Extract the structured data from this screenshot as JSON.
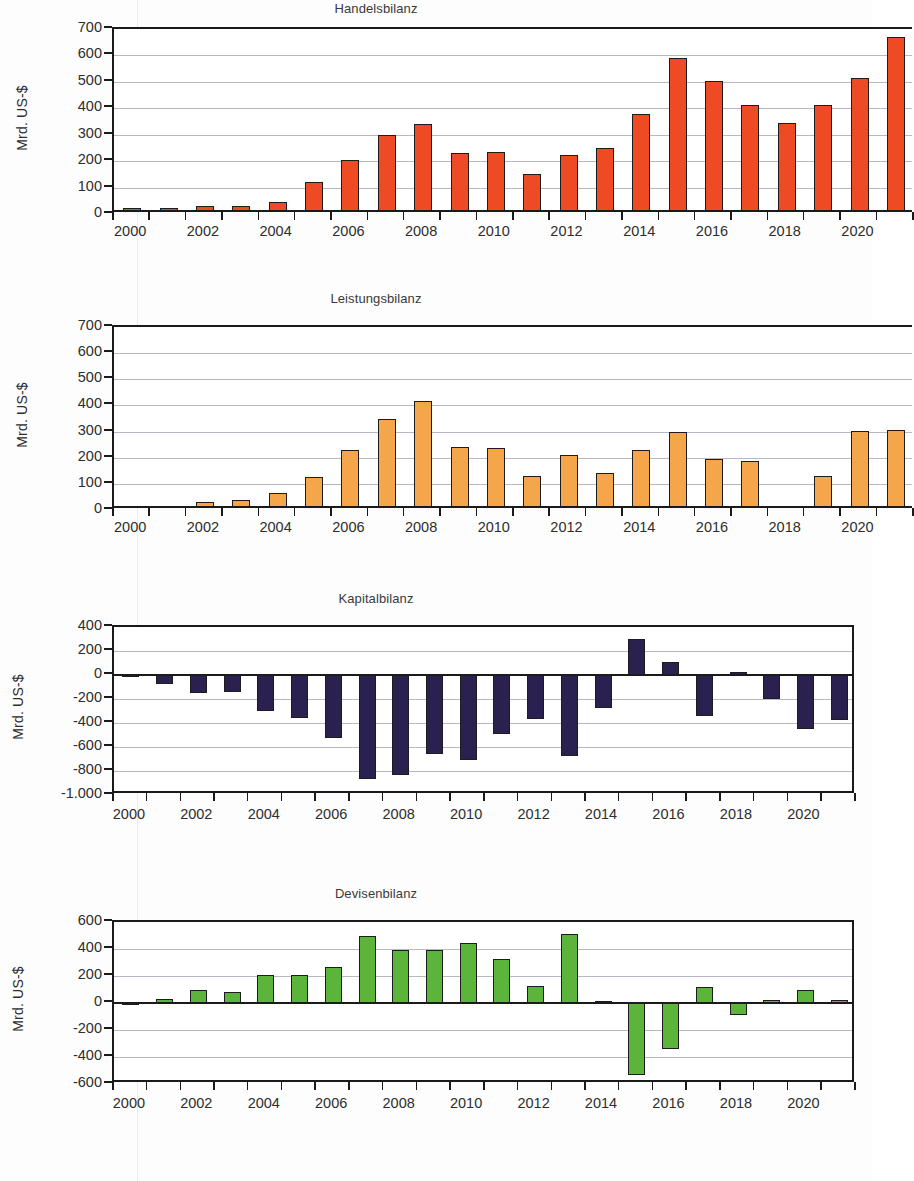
{
  "document": {
    "language": "de",
    "ylabel_text": "Mrd. US-$"
  },
  "palette": {
    "handelsbilanz": "#EE4B24",
    "leistungsbilanz": "#F5A githubPLACEHOLDER",
    "kapitalbilanz": "#2B2150",
    "devisenbilanz": "#5CB53A",
    "bar_outline": "#1C1C1C",
    "axis": "#1A1A1A",
    "grid": "#B9B9C4",
    "text": "#2D2D2D"
  },
  "chart_data": [
    {
      "id": "handelsbilanz",
      "type": "bar",
      "title": "Handelsbilanz",
      "ylabel": "Mrd. US-$",
      "xlabel": "",
      "color": "#EE4B24",
      "ylim": [
        0,
        700
      ],
      "yticks": [
        0,
        100,
        200,
        300,
        400,
        500,
        600,
        700
      ],
      "ytick_labels": [
        "0",
        "100",
        "200",
        "300",
        "400",
        "500",
        "600",
        "700"
      ],
      "grid": true,
      "legend": "none",
      "x": [
        2000,
        2001,
        2002,
        2003,
        2004,
        2005,
        2006,
        2007,
        2008,
        2009,
        2010,
        2011,
        2012,
        2013,
        2014,
        2015,
        2016,
        2017,
        2018,
        2019,
        2020,
        2021
      ],
      "xtick_labels": [
        "2000",
        "2002",
        "2004",
        "2006",
        "2008",
        "2010",
        "2012",
        "2014",
        "2016",
        "2018",
        "2020"
      ],
      "values": [
        24,
        22,
        30,
        32,
        44,
        120,
        204,
        301,
        341,
        232,
        234,
        150,
        225,
        251,
        377,
        590,
        503,
        412,
        343,
        414,
        516,
        670
      ]
    },
    {
      "id": "leistungsbilanz",
      "type": "bar",
      "title": "Leistungsbilanz",
      "ylabel": "Mrd. US-$",
      "xlabel": "",
      "color": "#F5A64A",
      "ylim": [
        0,
        700
      ],
      "yticks": [
        0,
        100,
        200,
        300,
        400,
        500,
        600,
        700
      ],
      "ytick_labels": [
        "0",
        "100",
        "200",
        "300",
        "400",
        "500",
        "600",
        "700"
      ],
      "grid": true,
      "legend": "none",
      "x": [
        2000,
        2001,
        2002,
        2003,
        2004,
        2005,
        2006,
        2007,
        2008,
        2009,
        2010,
        2011,
        2012,
        2013,
        2014,
        2015,
        2016,
        2017,
        2018,
        2019,
        2020,
        2021
      ],
      "xtick_labels": [
        "2000",
        "2002",
        "2004",
        "2006",
        "2008",
        "2010",
        "2012",
        "2014",
        "2016",
        "2018",
        "2020"
      ],
      "values": [
        16,
        12,
        31,
        39,
        65,
        128,
        230,
        350,
        417,
        240,
        236,
        130,
        210,
        143,
        231,
        299,
        196,
        189,
        15,
        131,
        302,
        308
      ]
    },
    {
      "id": "kapitalbilanz",
      "type": "bar",
      "title": "Kapitalbilanz",
      "ylabel": "Mrd. US-$",
      "xlabel": "",
      "color": "#2B2150",
      "ylim": [
        -1000,
        400
      ],
      "yticks": [
        -1000,
        -800,
        -600,
        -400,
        -200,
        0,
        200,
        400
      ],
      "ytick_labels": [
        "-1.000",
        "-800",
        "-600",
        "-400",
        "-200",
        "0",
        "200",
        "400"
      ],
      "grid": true,
      "legend": "none",
      "x": [
        2000,
        2001,
        2002,
        2003,
        2004,
        2005,
        2006,
        2007,
        2008,
        2009,
        2010,
        2011,
        2012,
        2013,
        2014,
        2015,
        2016,
        2017,
        2018,
        2019,
        2020,
        2021
      ],
      "xtick_labels": [
        "2000",
        "2002",
        "2004",
        "2006",
        "2008",
        "2010",
        "2012",
        "2014",
        "2016",
        "2018",
        "2020"
      ],
      "values": [
        -20,
        -72,
        -147,
        -143,
        -300,
        -355,
        -521,
        -868,
        -833,
        -659,
        -706,
        -491,
        -369,
        -673,
        -276,
        298,
        107,
        -345,
        25,
        -199,
        -450,
        -375
      ]
    },
    {
      "id": "devisenbilanz",
      "type": "bar",
      "title": "Devisenbilanz",
      "ylabel": "Mrd. US-$",
      "xlabel": "",
      "color": "#5CB53A",
      "ylim": [
        -600,
        600
      ],
      "yticks": [
        -600,
        -400,
        -200,
        0,
        200,
        400,
        600
      ],
      "ytick_labels": [
        "-600",
        "-400",
        "-200",
        "0",
        "200",
        "400",
        "600"
      ],
      "grid": true,
      "legend": "none",
      "x": [
        2000,
        2001,
        2002,
        2003,
        2004,
        2005,
        2006,
        2007,
        2008,
        2009,
        2010,
        2011,
        2012,
        2013,
        2014,
        2015,
        2016,
        2017,
        2018,
        2019,
        2020,
        2021
      ],
      "xtick_labels": [
        "2000",
        "2002",
        "2004",
        "2006",
        "2008",
        "2010",
        "2012",
        "2014",
        "2016",
        "2018",
        "2020"
      ],
      "values": [
        4,
        32,
        98,
        82,
        208,
        208,
        269,
        494,
        396,
        394,
        443,
        328,
        123,
        508,
        13,
        -533,
        -340,
        116,
        -85,
        22,
        94,
        19
      ]
    }
  ]
}
